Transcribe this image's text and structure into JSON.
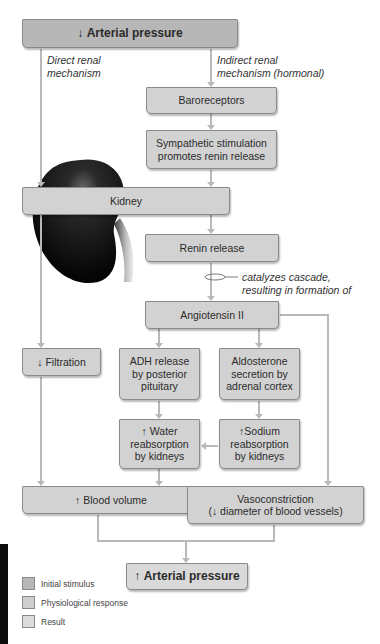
{
  "diagram": {
    "title_box": {
      "arrow": "↓",
      "text": "Arterial pressure",
      "kind": "stimulus"
    },
    "branch_labels": {
      "direct": "Direct renal\nmechanism",
      "indirect": "Indirect renal\nmechanism (hormonal)"
    },
    "nodes": {
      "baroreceptors": {
        "text": "Baroreceptors",
        "kind": "response"
      },
      "sympathetic": {
        "text": "Sympathetic stimulation promotes renin release",
        "kind": "response"
      },
      "kidney": {
        "text": "Kidney",
        "kind": "response"
      },
      "renin": {
        "text": "Renin release",
        "kind": "response"
      },
      "angiotensin": {
        "text": "Angiotensin II",
        "kind": "response"
      },
      "filtration": {
        "arrow": "↓",
        "text": "Filtration",
        "kind": "response"
      },
      "adh": {
        "text": "ADH release by posterior pituitary",
        "kind": "response"
      },
      "aldosterone": {
        "text": "Aldosterone secretion by adrenal cortex",
        "kind": "response"
      },
      "water": {
        "arrow": "↑",
        "text": "Water reabsorption by kidneys",
        "kind": "response"
      },
      "sodium": {
        "arrow": "↑",
        "text": "Sodium reabsorption by kidneys",
        "kind": "response"
      },
      "blood_volume": {
        "arrow": "↑",
        "text": "Blood volume",
        "kind": "response"
      },
      "vasoconstriction": {
        "line1": "Vasoconstriction",
        "line2_arrow": "↓",
        "line2": "diameter of blood vessels",
        "kind": "response"
      }
    },
    "cascade_note": "catalyzes cascade,\nresulting in formation of",
    "result_box": {
      "arrow": "↑",
      "text": "Arterial pressure",
      "kind": "result"
    },
    "legend": [
      {
        "label": "Initial stimulus",
        "color": "#b7b7b7"
      },
      {
        "label": "Physiological response",
        "color": "#cfcfcf"
      },
      {
        "label": "Result",
        "color": "#dcdcdc"
      }
    ],
    "colors": {
      "connector": "#b9b9b9",
      "box_border": "#8a8a8a",
      "kidney": "#111111"
    }
  }
}
